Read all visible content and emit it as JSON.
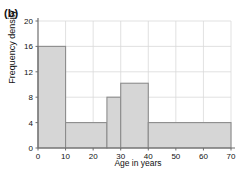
{
  "figure": {
    "panel_label": "(b)",
    "xlabel": "Age in years",
    "ylabel": "Frequency density"
  },
  "style": {
    "bar_fill": "#d6d6d6",
    "bar_stroke": "#8c8c8c",
    "grid_color": "#d9d9d9",
    "axis_color": "#6e6e6e",
    "text_color": "#111111",
    "background": "#ffffff"
  },
  "chart_data": {
    "type": "bar",
    "title": "",
    "subtitle": "",
    "xlabel": "Age in years",
    "ylabel": "Frequency density",
    "xlim": [
      0,
      70
    ],
    "ylim": [
      0,
      20
    ],
    "xticks": [
      0,
      10,
      20,
      30,
      40,
      50,
      60,
      70
    ],
    "xtick_labels": [
      "0",
      "10",
      "20",
      "30",
      "40",
      "50",
      "60",
      "70"
    ],
    "yticks": [
      0,
      4,
      8,
      12,
      16,
      20
    ],
    "ytick_labels": [
      "0",
      "4",
      "8",
      "12",
      "16",
      "20"
    ],
    "grid": true,
    "legend": false,
    "legend_position": "none",
    "histogram": true,
    "bin_edges": [
      0,
      10,
      25,
      30,
      40,
      70
    ],
    "bins": [
      {
        "x0": 0,
        "x1": 10,
        "label": "0-10",
        "width": 10,
        "value": 16.0,
        "frequency": 160
      },
      {
        "x0": 10,
        "x1": 25,
        "label": "10-25",
        "width": 15,
        "value": 4.0,
        "frequency": 60
      },
      {
        "x0": 25,
        "x1": 30,
        "label": "25-30",
        "width": 5,
        "value": 8.0,
        "frequency": 40
      },
      {
        "x0": 30,
        "x1": 40,
        "label": "30-40",
        "width": 10,
        "value": 10.2,
        "frequency": 102
      },
      {
        "x0": 40,
        "x1": 70,
        "label": "40-70",
        "width": 30,
        "value": 4.0,
        "frequency": 120
      }
    ],
    "categories": [
      "0-10",
      "10-25",
      "25-30",
      "30-40",
      "40-70"
    ],
    "values": [
      16.0,
      4.0,
      8.0,
      10.2,
      4.0
    ]
  }
}
